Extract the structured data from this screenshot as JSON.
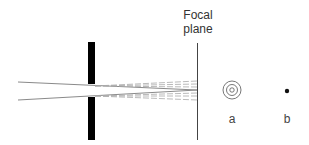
{
  "labels": {
    "focal_plane_line1": "Focal",
    "focal_plane_line2": "plane",
    "spot_a": "a",
    "spot_b": "b"
  },
  "colors": {
    "aperture": "#000000",
    "focal_plane": "#444444",
    "rays": "#8a8a8a",
    "dashed_rays": "#aaaaaa",
    "text": "#333333"
  },
  "geometry": {
    "aperture": {
      "x": 88,
      "width": 7,
      "top": 42,
      "bottom": 140,
      "gap_top": 84,
      "gap_bottom": 97
    },
    "focal_plane_x": 197,
    "focal_plane_top": 43,
    "focal_plane_bottom": 140
  }
}
